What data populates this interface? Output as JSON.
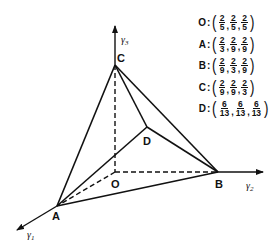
{
  "diagram": {
    "vertices": {
      "O": {
        "label": "O",
        "x": 115,
        "y": 172
      },
      "A": {
        "label": "A",
        "x": 57,
        "y": 206
      },
      "B": {
        "label": "B",
        "x": 218,
        "y": 172
      },
      "C": {
        "label": "C",
        "x": 115,
        "y": 65
      },
      "D": {
        "label": "D",
        "x": 147,
        "y": 127
      }
    },
    "axes": {
      "y1": {
        "symbol": "γ",
        "sub": "1"
      },
      "y2": {
        "symbol": "γ",
        "sub": "2"
      },
      "y3": {
        "symbol": "γ",
        "sub": "3"
      }
    },
    "solid_edges": [
      [
        "C",
        "A"
      ],
      [
        "C",
        "B"
      ],
      [
        "C",
        "D"
      ],
      [
        "D",
        "A"
      ],
      [
        "D",
        "B"
      ],
      [
        "A",
        "B"
      ]
    ],
    "dashed_edges": [
      [
        "C",
        "O"
      ],
      [
        "O",
        "B"
      ],
      [
        "O",
        "A"
      ]
    ]
  },
  "coordinates": [
    {
      "point": "O",
      "values": [
        {
          "num": "2",
          "den": "5"
        },
        {
          "num": "2",
          "den": "5"
        },
        {
          "num": "2",
          "den": "5"
        }
      ]
    },
    {
      "point": "A",
      "values": [
        {
          "num": "2",
          "den": "3"
        },
        {
          "num": "2",
          "den": "9"
        },
        {
          "num": "2",
          "den": "9"
        }
      ]
    },
    {
      "point": "B",
      "values": [
        {
          "num": "2",
          "den": "9"
        },
        {
          "num": "2",
          "den": "3"
        },
        {
          "num": "2",
          "den": "9"
        }
      ]
    },
    {
      "point": "C",
      "values": [
        {
          "num": "2",
          "den": "9"
        },
        {
          "num": "2",
          "den": "9"
        },
        {
          "num": "2",
          "den": "3"
        }
      ]
    },
    {
      "point": "D",
      "values": [
        {
          "num": "6",
          "den": "13"
        },
        {
          "num": "6",
          "den": "13"
        },
        {
          "num": "6",
          "den": "13"
        }
      ]
    }
  ],
  "punct": {
    "colon": ":",
    "open": "(",
    "close": ")",
    "comma": ","
  }
}
